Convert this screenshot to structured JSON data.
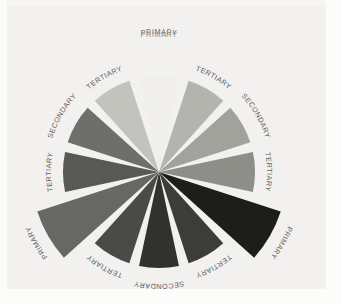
{
  "figure": {
    "title": "PRIMARY",
    "background_color": "#f2f1ef",
    "margin_color": "#fbfbfa",
    "gap_color": "#f2f1ef",
    "label_color": "#5d5d5b",
    "title_color": "#8e8e8c"
  },
  "chart_data": {
    "type": "pie",
    "title": "PRIMARY",
    "xlabel": "",
    "ylabel": "",
    "legend": "none",
    "grid": false,
    "center_x": 159,
    "center_y": 172,
    "wedge_count": 12,
    "wedge_angular_width_deg": 24,
    "wedge_gap_deg": 6,
    "categories": [
      "PRIMARY",
      "TERTIARY",
      "SECONDARY",
      "TERTIARY",
      "PRIMARY",
      "TERTIARY",
      "SECONDARY",
      "TERTIARY",
      "PRIMARY",
      "TERTIARY",
      "SECONDARY",
      "TERTIARY"
    ],
    "values": [
      96,
      96,
      96,
      96,
      128,
      96,
      96,
      96,
      128,
      96,
      96,
      96
    ],
    "colors": [
      "#f0efeb",
      "#b4b4ae",
      "#a2a29c",
      "#8e8e88",
      "#1d1d1b",
      "#3c3c3a",
      "#313130",
      "#4a4a48",
      "#676765",
      "#585856",
      "#6e6e6c",
      "#c3c3bd"
    ],
    "wedges": [
      {
        "index": 0,
        "label": "PRIMARY",
        "color": "#f0efeb",
        "mid_angle_deg": 270,
        "radius": 96,
        "label_radius": 138,
        "label_rotation": 0,
        "hue_name": "yellow"
      },
      {
        "index": 1,
        "label": "TERTIARY",
        "color": "#b4b4ae",
        "mid_angle_deg": 300,
        "radius": 96,
        "label_radius": 108,
        "label_rotation": 30,
        "hue_name": "yellow-green"
      },
      {
        "index": 2,
        "label": "SECONDARY",
        "color": "#a2a29c",
        "mid_angle_deg": 330,
        "radius": 96,
        "label_radius": 112,
        "label_rotation": 60,
        "hue_name": "green"
      },
      {
        "index": 3,
        "label": "TERTIARY",
        "color": "#8e8e88",
        "mid_angle_deg": 0,
        "radius": 96,
        "label_radius": 108,
        "label_rotation": 90,
        "hue_name": "blue-green"
      },
      {
        "index": 4,
        "label": "PRIMARY",
        "color": "#1d1d1b",
        "mid_angle_deg": 30,
        "radius": 128,
        "label_radius": 140,
        "label_rotation": 120,
        "hue_name": "blue"
      },
      {
        "index": 5,
        "label": "TERTIARY",
        "color": "#3c3c3a",
        "mid_angle_deg": 60,
        "radius": 96,
        "label_radius": 108,
        "label_rotation": 150,
        "hue_name": "blue-violet"
      },
      {
        "index": 6,
        "label": "SECONDARY",
        "color": "#313130",
        "mid_angle_deg": 90,
        "radius": 96,
        "label_radius": 112,
        "label_rotation": 180,
        "hue_name": "violet"
      },
      {
        "index": 7,
        "label": "TERTIARY",
        "color": "#4a4a48",
        "mid_angle_deg": 120,
        "radius": 96,
        "label_radius": 108,
        "label_rotation": 210,
        "hue_name": "red-violet"
      },
      {
        "index": 8,
        "label": "PRIMARY",
        "color": "#676765",
        "mid_angle_deg": 150,
        "radius": 128,
        "label_radius": 140,
        "label_rotation": 240,
        "hue_name": "red"
      },
      {
        "index": 9,
        "label": "TERTIARY",
        "color": "#585856",
        "mid_angle_deg": 180,
        "radius": 96,
        "label_radius": 108,
        "label_rotation": 270,
        "hue_name": "red-orange"
      },
      {
        "index": 10,
        "label": "SECONDARY",
        "color": "#6e6e6c",
        "mid_angle_deg": 210,
        "radius": 96,
        "label_radius": 112,
        "label_rotation": 300,
        "hue_name": "orange"
      },
      {
        "index": 11,
        "label": "TERTIARY",
        "color": "#c3c3bd",
        "mid_angle_deg": 240,
        "radius": 96,
        "label_radius": 108,
        "label_rotation": 330,
        "hue_name": "yellow-orange"
      }
    ]
  }
}
